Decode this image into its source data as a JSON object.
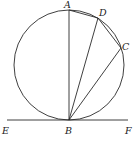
{
  "diagram": {
    "type": "circle-tangent-chords",
    "circle": {
      "cx": 69,
      "cy": 65,
      "r": 55
    },
    "points": {
      "A": {
        "x": 69,
        "y": 10
      },
      "B": {
        "x": 69,
        "y": 120
      },
      "C": {
        "x": 121,
        "y": 48
      },
      "D": {
        "x": 98,
        "y": 18
      },
      "E": {
        "x": 7,
        "y": 120
      },
      "F": {
        "x": 128,
        "y": 120
      }
    },
    "labels": {
      "A": "A",
      "B": "B",
      "C": "C",
      "D": "D",
      "E": "E",
      "F": "F"
    },
    "segments": [
      "AB",
      "AD",
      "DC",
      "BD",
      "BC",
      "EF"
    ],
    "tangent_line": "EF",
    "tangent_point": "B",
    "colors": {
      "stroke": "#2a2a2a",
      "label": "#222222",
      "background": "#ffffff"
    }
  }
}
